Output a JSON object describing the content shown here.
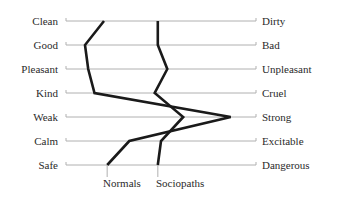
{
  "chart_data": {
    "type": "line",
    "subtype": "semantic-differential-profile",
    "title": "",
    "xlabel": "",
    "ylabel": "",
    "scale_points": 7,
    "scale_note": "Values are estimated from line position between left (1) and right (7) anchors; no numeric axis is shown.",
    "categories": [
      {
        "left": "Clean",
        "right": "Dirty"
      },
      {
        "left": "Good",
        "right": "Bad"
      },
      {
        "left": "Pleasant",
        "right": "Unpleasant"
      },
      {
        "left": "Kind",
        "right": "Cruel"
      },
      {
        "left": "Weak",
        "right": "Strong"
      },
      {
        "left": "Calm",
        "right": "Excitable"
      },
      {
        "left": "Safe",
        "right": "Dangerous"
      }
    ],
    "series": [
      {
        "name": "Normals",
        "values": [
          2.2,
          1.6,
          1.7,
          1.9,
          6.2,
          3.0,
          2.3
        ]
      },
      {
        "name": "Sociopaths",
        "values": [
          3.9,
          3.9,
          4.2,
          3.8,
          4.7,
          4.0,
          3.9
        ]
      }
    ],
    "grid": true,
    "legend_position": "bottom, labels under line endpoints"
  },
  "labels": {
    "left": [
      "Clean",
      "Good",
      "Pleasant",
      "Kind",
      "Weak",
      "Calm",
      "Safe"
    ],
    "right": [
      "Dirty",
      "Bad",
      "Unpleasant",
      "Cruel",
      "Strong",
      "Excitable",
      "Dangerous"
    ],
    "series_normals": "Normals",
    "series_sociopaths": "Sociopaths"
  },
  "colors": {
    "line": "#1a1a1a",
    "grid": "#b0b0b0",
    "text": "#2a2a2a"
  }
}
